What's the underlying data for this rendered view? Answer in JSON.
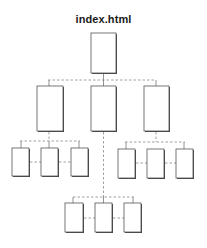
{
  "title": "index.html",
  "colors": {
    "box_border": "#555555",
    "box_shadow": "#444444",
    "connector": "#888888",
    "title": "#1a1a1a"
  },
  "sitemap": {
    "root": {
      "label": "index.html"
    },
    "sections": [
      {
        "id": "section-left",
        "children": 3
      },
      {
        "id": "section-center",
        "children": 3
      },
      {
        "id": "section-right",
        "children": 3
      }
    ]
  }
}
